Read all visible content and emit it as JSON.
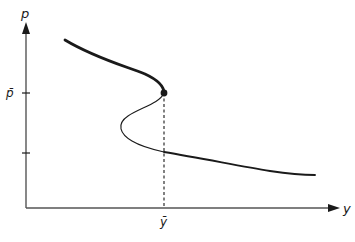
{
  "diagram": {
    "type": "backward-bending curve (S-shaped) in p–y space",
    "axes": {
      "vertical_label": "p",
      "horizontal_label": "y"
    },
    "ticks": {
      "p_bar_label": "p̄",
      "y_bar_label": "ȳ",
      "lower_tick": ""
    },
    "curve_segments": [
      {
        "name": "upper-branch",
        "style": "thick",
        "description": "descending thick curve ending at critical point"
      },
      {
        "name": "middle-branch",
        "style": "thin",
        "description": "thin S-shaped fold bending back to the left"
      },
      {
        "name": "lower-branch",
        "style": "medium",
        "description": "descending curve continuing to the right"
      }
    ],
    "critical_point": {
      "label": "(ȳ, p̄)",
      "marker": "filled dot"
    },
    "guide_line": {
      "style": "dashed",
      "from": "critical point",
      "to": "horizontal axis at ȳ"
    },
    "colors": {
      "ink": "#1a1a1a",
      "axis": "#555555",
      "background": "#ffffff"
    }
  }
}
